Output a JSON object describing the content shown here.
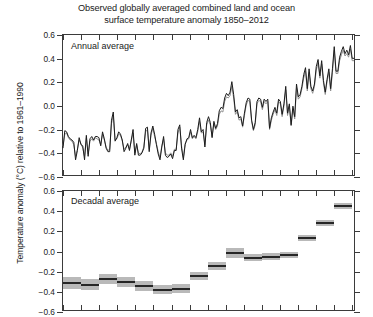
{
  "title": "Observed globally averaged combined land and ocean\nsurface temperature anomaly 1850–2012",
  "title_line1": "Observed globally averaged combined land and ocean",
  "title_line2": "surface temperature anomaly 1850–2012",
  "ylabel": "Temperature anomaly (°C) relative to 1961–1990",
  "panels": {
    "annual": {
      "label": "Annual average"
    },
    "decadal": {
      "label": "Decadal average"
    }
  },
  "axis": {
    "ytick_labels": [
      "0.6",
      "0.4",
      "0.2",
      "0.0",
      "−0.2",
      "−0.4",
      "−0.6"
    ],
    "ytick_values": [
      0.6,
      0.4,
      0.2,
      0.0,
      -0.2,
      -0.4,
      -0.6
    ],
    "ylim": [
      -0.6,
      0.6
    ],
    "xlim": [
      1850,
      2012
    ],
    "xtick_values": [
      1850,
      1860,
      1870,
      1880,
      1890,
      1900,
      1910,
      1920,
      1930,
      1940,
      1950,
      1960,
      1970,
      1980,
      1990,
      2000,
      2010
    ],
    "xtick_labels_visible": false
  },
  "colors": {
    "series_primary": "#1a1a1a",
    "series_secondary": "#8f8f8f",
    "bar_uncertainty": "#b9b9b9",
    "bar_mean": "#262626",
    "axis": "#3b3b3b",
    "background": "#ffffff"
  },
  "chart_data": {
    "type": "line",
    "title": "Observed globally averaged combined land and ocean surface temperature anomaly 1850–2012",
    "xlabel": "",
    "ylabel": "Temperature anomaly (°C) relative to 1961–1990",
    "ylim": [
      -0.6,
      0.6
    ],
    "xlim": [
      1850,
      2012
    ],
    "grid": false,
    "legend": "none",
    "panels": [
      {
        "name": "Annual average",
        "type": "line",
        "x": [
          1850,
          1851,
          1852,
          1853,
          1854,
          1855,
          1856,
          1857,
          1858,
          1859,
          1860,
          1861,
          1862,
          1863,
          1864,
          1865,
          1866,
          1867,
          1868,
          1869,
          1870,
          1871,
          1872,
          1873,
          1874,
          1875,
          1876,
          1877,
          1878,
          1879,
          1880,
          1881,
          1882,
          1883,
          1884,
          1885,
          1886,
          1887,
          1888,
          1889,
          1890,
          1891,
          1892,
          1893,
          1894,
          1895,
          1896,
          1897,
          1898,
          1899,
          1900,
          1901,
          1902,
          1903,
          1904,
          1905,
          1906,
          1907,
          1908,
          1909,
          1910,
          1911,
          1912,
          1913,
          1914,
          1915,
          1916,
          1917,
          1918,
          1919,
          1920,
          1921,
          1922,
          1923,
          1924,
          1925,
          1926,
          1927,
          1928,
          1929,
          1930,
          1931,
          1932,
          1933,
          1934,
          1935,
          1936,
          1937,
          1938,
          1939,
          1940,
          1941,
          1942,
          1943,
          1944,
          1945,
          1946,
          1947,
          1948,
          1949,
          1950,
          1951,
          1952,
          1953,
          1954,
          1955,
          1956,
          1957,
          1958,
          1959,
          1960,
          1961,
          1962,
          1963,
          1964,
          1965,
          1966,
          1967,
          1968,
          1969,
          1970,
          1971,
          1972,
          1973,
          1974,
          1975,
          1976,
          1977,
          1978,
          1979,
          1980,
          1981,
          1982,
          1983,
          1984,
          1985,
          1986,
          1987,
          1988,
          1989,
          1990,
          1991,
          1992,
          1993,
          1994,
          1995,
          1996,
          1997,
          1998,
          1999,
          2000,
          2001,
          2002,
          2003,
          2004,
          2005,
          2006,
          2007,
          2008,
          2009,
          2010,
          2011,
          2012
        ],
        "series": [
          {
            "name": "HadCRUT4",
            "color": "#1a1a1a",
            "values": [
              -0.37,
              -0.22,
              -0.23,
              -0.27,
              -0.29,
              -0.3,
              -0.32,
              -0.47,
              -0.39,
              -0.28,
              -0.34,
              -0.35,
              -0.47,
              -0.26,
              -0.44,
              -0.29,
              -0.27,
              -0.3,
              -0.27,
              -0.27,
              -0.28,
              -0.35,
              -0.23,
              -0.29,
              -0.37,
              -0.4,
              -0.4,
              -0.13,
              -0.06,
              -0.31,
              -0.28,
              -0.23,
              -0.25,
              -0.3,
              -0.4,
              -0.37,
              -0.33,
              -0.39,
              -0.3,
              -0.21,
              -0.43,
              -0.33,
              -0.43,
              -0.43,
              -0.41,
              -0.37,
              -0.2,
              -0.19,
              -0.4,
              -0.24,
              -0.18,
              -0.25,
              -0.34,
              -0.42,
              -0.47,
              -0.36,
              -0.27,
              -0.43,
              -0.45,
              -0.44,
              -0.42,
              -0.46,
              -0.39,
              -0.39,
              -0.21,
              -0.17,
              -0.37,
              -0.47,
              -0.34,
              -0.29,
              -0.28,
              -0.21,
              -0.28,
              -0.26,
              -0.28,
              -0.21,
              -0.11,
              -0.23,
              -0.21,
              -0.36,
              -0.15,
              -0.1,
              -0.15,
              -0.28,
              -0.14,
              -0.2,
              -0.16,
              -0.05,
              -0.02,
              -0.03,
              0.06,
              0.1,
              0.08,
              0.11,
              0.2,
              0.09,
              -0.06,
              -0.04,
              -0.11,
              -0.1,
              -0.18,
              -0.07,
              0.02,
              0.06,
              0.05,
              -0.13,
              -0.21,
              -0.15,
              0.03,
              0.06,
              0.05,
              -0.02,
              0.05,
              0.03,
              0.05,
              -0.2,
              -0.11,
              -0.06,
              -0.02,
              -0.07,
              0.05,
              0.03,
              -0.08,
              0.01,
              0.16,
              -0.07,
              0.01,
              -0.17,
              -0.01,
              -0.1,
              0.18,
              0.07,
              0.09,
              0.16,
              0.26,
              0.32,
              0.14,
              0.31,
              0.16,
              0.12,
              0.18,
              0.33,
              0.39,
              0.25,
              0.38,
              0.21,
              0.11,
              0.22,
              0.31,
              0.14,
              0.31,
              0.5,
              0.29,
              0.29,
              0.41,
              0.46,
              0.5,
              0.44,
              0.47,
              0.43,
              0.51,
              0.4,
              0.4,
              0.52,
              0.42,
              0.45
            ]
          },
          {
            "name": "Alternative dataset",
            "color": "#8f8f8f",
            "values": [
              -0.35,
              -0.25,
              -0.24,
              -0.28,
              -0.3,
              -0.31,
              -0.34,
              -0.44,
              -0.38,
              -0.3,
              -0.33,
              -0.37,
              -0.44,
              -0.28,
              -0.42,
              -0.31,
              -0.29,
              -0.31,
              -0.28,
              -0.29,
              -0.3,
              -0.34,
              -0.25,
              -0.3,
              -0.36,
              -0.39,
              -0.38,
              -0.16,
              -0.09,
              -0.3,
              -0.29,
              -0.25,
              -0.26,
              -0.31,
              -0.38,
              -0.36,
              -0.34,
              -0.38,
              -0.31,
              -0.24,
              -0.41,
              -0.34,
              -0.41,
              -0.42,
              -0.4,
              -0.36,
              -0.23,
              -0.21,
              -0.38,
              -0.26,
              -0.2,
              -0.27,
              -0.33,
              -0.4,
              -0.45,
              -0.35,
              -0.29,
              -0.41,
              -0.43,
              -0.43,
              -0.41,
              -0.44,
              -0.38,
              -0.38,
              -0.24,
              -0.19,
              -0.35,
              -0.45,
              -0.33,
              -0.3,
              -0.29,
              -0.23,
              -0.29,
              -0.27,
              -0.29,
              -0.23,
              -0.14,
              -0.24,
              -0.23,
              -0.34,
              -0.17,
              -0.13,
              -0.17,
              -0.27,
              -0.16,
              -0.21,
              -0.18,
              -0.08,
              -0.05,
              -0.06,
              0.03,
              0.07,
              0.06,
              0.08,
              0.16,
              0.06,
              -0.08,
              -0.06,
              -0.13,
              -0.12,
              -0.19,
              -0.09,
              0.0,
              0.04,
              0.03,
              -0.14,
              -0.22,
              -0.17,
              0.01,
              0.04,
              0.03,
              -0.04,
              0.03,
              0.01,
              0.03,
              -0.21,
              -0.13,
              -0.08,
              -0.04,
              -0.09,
              0.03,
              0.01,
              -0.1,
              -0.01,
              0.13,
              -0.09,
              -0.01,
              -0.18,
              -0.03,
              -0.12,
              0.15,
              0.05,
              0.07,
              0.14,
              0.23,
              0.29,
              0.12,
              0.28,
              0.14,
              0.1,
              0.16,
              0.3,
              0.36,
              0.23,
              0.35,
              0.19,
              0.09,
              0.2,
              0.28,
              0.12,
              0.28,
              0.47,
              0.27,
              0.27,
              0.38,
              0.43,
              0.47,
              0.42,
              0.44,
              0.41,
              0.48,
              0.38,
              0.38,
              0.49,
              0.4,
              0.43
            ]
          }
        ]
      },
      {
        "name": "Decadal average",
        "type": "bar",
        "decades": [
          {
            "label": "1850s",
            "start": 1850,
            "end": 1860,
            "mean": -0.31,
            "low": -0.37,
            "high": -0.25
          },
          {
            "label": "1860s",
            "start": 1860,
            "end": 1870,
            "mean": -0.33,
            "low": -0.38,
            "high": -0.27
          },
          {
            "label": "1870s",
            "start": 1870,
            "end": 1880,
            "mean": -0.27,
            "low": -0.32,
            "high": -0.22
          },
          {
            "label": "1880s",
            "start": 1880,
            "end": 1890,
            "mean": -0.3,
            "low": -0.35,
            "high": -0.25
          },
          {
            "label": "1890s",
            "start": 1890,
            "end": 1900,
            "mean": -0.34,
            "low": -0.39,
            "high": -0.29
          },
          {
            "label": "1900s",
            "start": 1900,
            "end": 1910,
            "mean": -0.38,
            "low": -0.42,
            "high": -0.33
          },
          {
            "label": "1910s",
            "start": 1910,
            "end": 1920,
            "mean": -0.37,
            "low": -0.41,
            "high": -0.32
          },
          {
            "label": "1920s",
            "start": 1920,
            "end": 1930,
            "mean": -0.24,
            "low": -0.28,
            "high": -0.2
          },
          {
            "label": "1930s",
            "start": 1930,
            "end": 1940,
            "mean": -0.14,
            "low": -0.18,
            "high": -0.1
          },
          {
            "label": "1940s",
            "start": 1940,
            "end": 1950,
            "mean": -0.01,
            "low": -0.06,
            "high": 0.03
          },
          {
            "label": "1950s",
            "start": 1950,
            "end": 1960,
            "mean": -0.06,
            "low": -0.09,
            "high": -0.02
          },
          {
            "label": "1960s",
            "start": 1960,
            "end": 1970,
            "mean": -0.05,
            "low": -0.08,
            "high": -0.01
          },
          {
            "label": "1970s",
            "start": 1970,
            "end": 1980,
            "mean": -0.03,
            "low": -0.06,
            "high": 0.0
          },
          {
            "label": "1980s",
            "start": 1980,
            "end": 1990,
            "mean": 0.13,
            "low": 0.1,
            "high": 0.16
          },
          {
            "label": "1990s",
            "start": 1990,
            "end": 2000,
            "mean": 0.28,
            "low": 0.25,
            "high": 0.31
          },
          {
            "label": "2000s",
            "start": 2000,
            "end": 2010,
            "mean": 0.45,
            "low": 0.42,
            "high": 0.48
          }
        ]
      }
    ]
  }
}
